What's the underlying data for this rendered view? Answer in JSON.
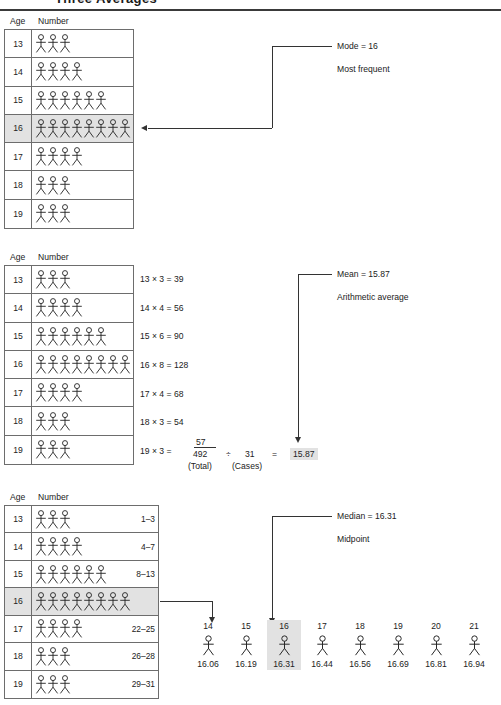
{
  "page": {
    "title": "Three Averages"
  },
  "captions": {
    "age": "Age",
    "number": "Number"
  },
  "mode_section": {
    "rows": [
      {
        "age": "13",
        "count": 3
      },
      {
        "age": "14",
        "count": 4
      },
      {
        "age": "15",
        "count": 6
      },
      {
        "age": "16",
        "count": 8
      },
      {
        "age": "17",
        "count": 4
      },
      {
        "age": "18",
        "count": 3
      },
      {
        "age": "19",
        "count": 3
      }
    ],
    "highlight_age": "16",
    "annotation_title": "Mode = 16",
    "annotation_sub": "Most frequent"
  },
  "mean_section": {
    "rows": [
      {
        "age": "13",
        "count": 3,
        "calc": "13 × 3 = 39"
      },
      {
        "age": "14",
        "count": 4,
        "calc": "14 × 4 = 56"
      },
      {
        "age": "15",
        "count": 6,
        "calc": "15 × 6 = 90"
      },
      {
        "age": "16",
        "count": 8,
        "calc": "16 × 8 = 128"
      },
      {
        "age": "17",
        "count": 4,
        "calc": "17 × 4 = 68"
      },
      {
        "age": "18",
        "count": 3,
        "calc": "18 × 3 = 54"
      },
      {
        "age": "19",
        "count": 3,
        "calc": "19 × 3 = "
      }
    ],
    "last_addend": "57",
    "total": "492",
    "divide_sign": "÷",
    "cases": "31",
    "equals": "=",
    "result": "15.87",
    "total_label": "(Total)",
    "cases_label": "(Cases)",
    "annotation_title": "Mean = 15.87",
    "annotation_sub": "Arithmetic average"
  },
  "median_section": {
    "rows": [
      {
        "age": "13",
        "count": 3,
        "rank": "1–3"
      },
      {
        "age": "14",
        "count": 4,
        "rank": "4–7"
      },
      {
        "age": "15",
        "count": 6,
        "rank": "8–13"
      },
      {
        "age": "16",
        "count": 8,
        "rank": ""
      },
      {
        "age": "17",
        "count": 4,
        "rank": "22–25"
      },
      {
        "age": "18",
        "count": 3,
        "rank": "26–28"
      },
      {
        "age": "19",
        "count": 3,
        "rank": "29–31"
      }
    ],
    "highlight_age": "16",
    "annotation_title": "Median = 16.31",
    "annotation_sub": "Midpoint",
    "scale": {
      "ranks": [
        "14",
        "15",
        "16",
        "17",
        "18",
        "19",
        "20",
        "21"
      ],
      "values": [
        "16.06",
        "16.19",
        "16.31",
        "16.44",
        "16.56",
        "16.69",
        "16.81",
        "16.94"
      ],
      "highlight_index": 2
    }
  },
  "colors": {
    "highlight": "#e2e2e2",
    "rule": "#6d6d6d",
    "ink": "#222222"
  }
}
